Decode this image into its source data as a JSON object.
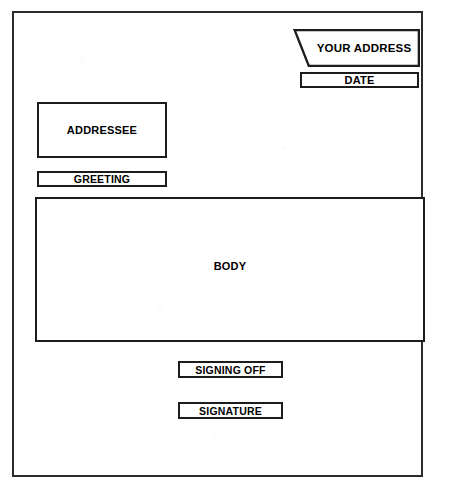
{
  "diagram": {
    "frame": {
      "name": "outer-page-border"
    },
    "blocks": [
      {
        "id": "your-address",
        "label": "YOUR ADDRESS",
        "shape": "slanted-quadrilateral"
      },
      {
        "id": "date",
        "label": "DATE",
        "shape": "rectangle"
      },
      {
        "id": "addressee",
        "label": "ADDRESSEE",
        "shape": "rectangle"
      },
      {
        "id": "greeting",
        "label": "GREETING",
        "shape": "rectangle"
      },
      {
        "id": "body",
        "label": "BODY",
        "shape": "rectangle"
      },
      {
        "id": "signing-off",
        "label": "SIGNING OFF",
        "shape": "rectangle"
      },
      {
        "id": "signature",
        "label": "SIGNATURE",
        "shape": "rectangle"
      }
    ],
    "page_marker": "",
    "colors": {
      "line": "#1c1c1c",
      "frame": "#2b2b2b",
      "background": "#ffffff",
      "text": "#000000"
    }
  }
}
